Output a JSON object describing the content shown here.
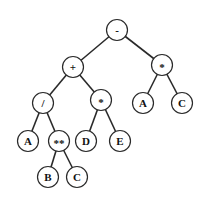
{
  "diagram": {
    "type": "expression-tree",
    "node_radius": 10.5,
    "colors": {
      "stroke": "#2a2a2a",
      "fill": "#ffffff",
      "text": "#111111",
      "background": "#ffffff"
    },
    "nodes": [
      {
        "id": "n0",
        "label": "-",
        "x": 117,
        "y": 30
      },
      {
        "id": "n1",
        "label": "+",
        "x": 73,
        "y": 67
      },
      {
        "id": "n2",
        "label": "*",
        "x": 162,
        "y": 65
      },
      {
        "id": "n3",
        "label": "/",
        "x": 43,
        "y": 103
      },
      {
        "id": "n4",
        "label": "*",
        "x": 101,
        "y": 100
      },
      {
        "id": "n5",
        "label": "A",
        "x": 143,
        "y": 103
      },
      {
        "id": "n6",
        "label": "C",
        "x": 182,
        "y": 103
      },
      {
        "id": "n7",
        "label": "A",
        "x": 28,
        "y": 141
      },
      {
        "id": "n8",
        "label": "**",
        "x": 59,
        "y": 141
      },
      {
        "id": "n9",
        "label": "D",
        "x": 86,
        "y": 141
      },
      {
        "id": "n10",
        "label": "E",
        "x": 120,
        "y": 141
      },
      {
        "id": "n11",
        "label": "B",
        "x": 48,
        "y": 177
      },
      {
        "id": "n12",
        "label": "C",
        "x": 77,
        "y": 177
      }
    ],
    "edges": [
      [
        "n0",
        "n1"
      ],
      [
        "n0",
        "n2"
      ],
      [
        "n1",
        "n3"
      ],
      [
        "n1",
        "n4"
      ],
      [
        "n2",
        "n5"
      ],
      [
        "n2",
        "n6"
      ],
      [
        "n3",
        "n7"
      ],
      [
        "n3",
        "n8"
      ],
      [
        "n4",
        "n9"
      ],
      [
        "n4",
        "n10"
      ],
      [
        "n8",
        "n11"
      ],
      [
        "n8",
        "n12"
      ]
    ]
  }
}
